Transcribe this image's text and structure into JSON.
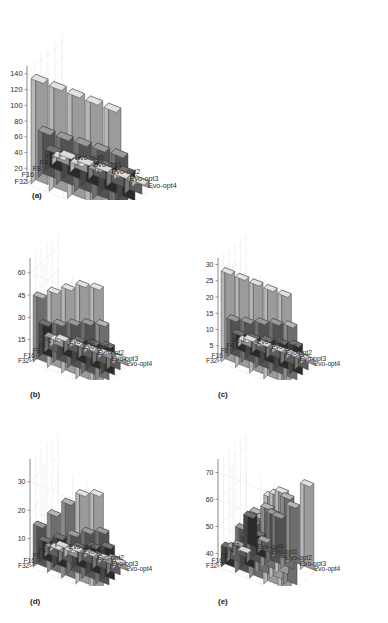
{
  "figure": {
    "type": "multi-panel-3d-bar-figure",
    "panel_count": 5,
    "background_color": "#ffffff",
    "grid_color": "#e9e9e9",
    "axis_color": "#6f6f6f",
    "bar_edge_color": "#3a3a3a"
  },
  "panels": [
    {
      "id": "a",
      "label": "(a)",
      "zticks": [
        20,
        40,
        60,
        80,
        100,
        120,
        140
      ],
      "zmax": 150
    },
    {
      "id": "b",
      "label": "(b)",
      "zticks": [
        15,
        30,
        45,
        60
      ],
      "zmax": 70
    },
    {
      "id": "c",
      "label": "(c)",
      "zticks": [
        5,
        10,
        15,
        20,
        25,
        30
      ],
      "zmax": 32
    },
    {
      "id": "d",
      "label": "(d)",
      "zticks": [
        10,
        20,
        30
      ],
      "zmax": 38
    },
    {
      "id": "e",
      "label": "(e)",
      "zticks": [
        40,
        50,
        60,
        70
      ],
      "zmax": 75
    }
  ],
  "axes": {
    "y_categories": [
      "F32",
      "F16",
      "F8",
      "F4",
      "F2"
    ],
    "x_categories": [
      "Evo-opt0",
      "Evo-opt1",
      "Evo-opt2",
      "Evo-opt3",
      "Evo-opt4"
    ]
  },
  "chart_data": [
    {
      "type": "bar",
      "id": "a",
      "title": "(a)",
      "xlabel": "",
      "ylabel": "",
      "zlabel": "",
      "categories": [
        "Evo-opt0",
        "Evo-opt1",
        "Evo-opt2",
        "Evo-opt3",
        "Evo-opt4"
      ],
      "rows": [
        "F32",
        "F16",
        "F8",
        "F4",
        "F2"
      ],
      "zlim": [
        0,
        150
      ],
      "zticks": [
        20,
        40,
        60,
        80,
        100,
        120,
        140
      ],
      "grid": true,
      "legend": "none",
      "series": [
        {
          "name": "F32",
          "values": [
            134,
            134,
            134,
            134,
            134
          ]
        },
        {
          "name": "F16",
          "values": [
            60,
            62,
            64,
            66,
            68
          ]
        },
        {
          "name": "F8",
          "values": [
            28,
            30,
            33,
            36,
            38
          ]
        },
        {
          "name": "F4",
          "values": [
            12,
            13,
            15,
            17,
            18
          ]
        },
        {
          "name": "F2",
          "values": [
            5,
            6,
            7,
            8,
            9
          ]
        }
      ]
    },
    {
      "type": "bar",
      "id": "b",
      "title": "(b)",
      "xlabel": "",
      "ylabel": "",
      "zlabel": "",
      "categories": [
        "Evo-opt0",
        "Evo-opt1",
        "Evo-opt2",
        "Evo-opt3",
        "Evo-opt4"
      ],
      "rows": [
        "F32",
        "F16",
        "F8",
        "F4",
        "F2"
      ],
      "zlim": [
        0,
        70
      ],
      "zticks": [
        15,
        30,
        45,
        60
      ],
      "grid": true,
      "legend": "none",
      "series": [
        {
          "name": "F32",
          "values": [
            45,
            52,
            58,
            64,
            66
          ]
        },
        {
          "name": "F16",
          "values": [
            23,
            27,
            31,
            35,
            38
          ]
        },
        {
          "name": "F8",
          "values": [
            11,
            13,
            16,
            18,
            20
          ]
        },
        {
          "name": "F4",
          "values": [
            6,
            7,
            8,
            9,
            10
          ]
        },
        {
          "name": "F2",
          "values": [
            3,
            3.5,
            4,
            4.5,
            5
          ]
        }
      ]
    },
    {
      "type": "bar",
      "id": "c",
      "title": "(c)",
      "xlabel": "",
      "ylabel": "",
      "zlabel": "",
      "categories": [
        "Evo-opt0",
        "Evo-opt1",
        "Evo-opt2",
        "Evo-opt3",
        "Evo-opt4"
      ],
      "rows": [
        "F32",
        "F16",
        "F8",
        "F4",
        "F2"
      ],
      "zlim": [
        0,
        32
      ],
      "zticks": [
        5,
        10,
        15,
        20,
        25,
        30
      ],
      "grid": true,
      "legend": "none",
      "series": [
        {
          "name": "F32",
          "values": [
            28,
            28,
            28,
            28,
            28
          ]
        },
        {
          "name": "F16",
          "values": [
            12,
            13,
            14.5,
            16,
            17
          ]
        },
        {
          "name": "F8",
          "values": [
            6,
            6.5,
            7.5,
            8.5,
            9.5
          ]
        },
        {
          "name": "F4",
          "values": [
            2.5,
            3,
            3.5,
            4,
            4.5
          ]
        },
        {
          "name": "F2",
          "values": [
            1.2,
            1.4,
            1.6,
            1.8,
            2
          ]
        }
      ]
    },
    {
      "type": "bar",
      "id": "d",
      "title": "(d)",
      "xlabel": "",
      "ylabel": "",
      "zlabel": "",
      "categories": [
        "Evo-opt0",
        "Evo-opt1",
        "Evo-opt2",
        "Evo-opt3",
        "Evo-opt4"
      ],
      "rows": [
        "F32",
        "F16",
        "F8",
        "F4",
        "F2"
      ],
      "zlim": [
        0,
        38
      ],
      "zticks": [
        10,
        20,
        30
      ],
      "grid": true,
      "legend": "none",
      "series": [
        {
          "name": "F32",
          "values": [
            15,
            21,
            27,
            32,
            34
          ]
        },
        {
          "name": "F16",
          "values": [
            8,
            11,
            14,
            17,
            19
          ]
        },
        {
          "name": "F8",
          "values": [
            4,
            6,
            8,
            10,
            12
          ]
        },
        {
          "name": "F4",
          "values": [
            2,
            3,
            4,
            5,
            6
          ]
        },
        {
          "name": "F2",
          "values": [
            1,
            1.5,
            2,
            2.5,
            3
          ]
        }
      ]
    },
    {
      "type": "bar",
      "id": "e",
      "title": "(e)",
      "xlabel": "",
      "ylabel": "",
      "zlabel": "",
      "categories": [
        "Evo-opt0",
        "Evo-opt1",
        "Evo-opt2",
        "Evo-opt3",
        "Evo-opt4"
      ],
      "rows": [
        "F32",
        "F16",
        "F8",
        "F4",
        "F2"
      ],
      "zlim": [
        35,
        75
      ],
      "zticks": [
        40,
        50,
        60,
        70
      ],
      "grid": true,
      "legend": "none",
      "series": [
        {
          "name": "F32",
          "values": [
            43,
            52,
            60,
            68,
            64
          ]
        },
        {
          "name": "F16",
          "values": [
            41,
            47,
            56,
            67,
            62
          ]
        },
        {
          "name": "F8",
          "values": [
            40,
            50,
            58,
            66,
            0
          ]
        },
        {
          "name": "F4",
          "values": [
            36,
            44,
            54,
            62,
            0
          ]
        },
        {
          "name": "F2",
          "values": [
            47,
            40,
            51,
            57,
            67
          ]
        }
      ]
    }
  ]
}
